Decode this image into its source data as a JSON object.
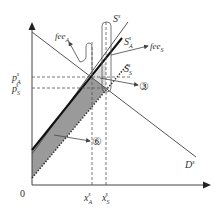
{
  "diagram": {
    "type": "supply-demand",
    "origin_label": "0",
    "axis_y_label": "",
    "axis_x_label": "",
    "price_labels": {
      "pA": {
        "base": "p",
        "sub": "A",
        "sup": "s"
      },
      "pS": {
        "base": "p",
        "sub": "S",
        "sup": "s"
      }
    },
    "quantity_labels": {
      "xA": {
        "base": "x",
        "sub": "A",
        "sup": "s"
      },
      "xS": {
        "base": "x",
        "sub": "S",
        "sup": "s"
      }
    },
    "curves": {
      "demand": {
        "base": "D",
        "sub": "",
        "sup": "s"
      },
      "supply": {
        "base": "S",
        "sub": "",
        "sup": "s"
      },
      "supply_A": {
        "base": "S",
        "sub": "A",
        "sup": "s"
      },
      "supply_S": {
        "base": "S",
        "sub": "S",
        "sup": "s"
      }
    },
    "annotations": {
      "feeA": {
        "base": "fee",
        "sub": "A"
      },
      "feeS": {
        "base": "fee",
        "sub": "S"
      },
      "area3": "③",
      "area6": "⑥"
    },
    "colors": {
      "line": "#444444",
      "dark_fill": "#9a9a9a",
      "light_fill": "#dcdcdc",
      "thick_line": "#111111"
    }
  }
}
